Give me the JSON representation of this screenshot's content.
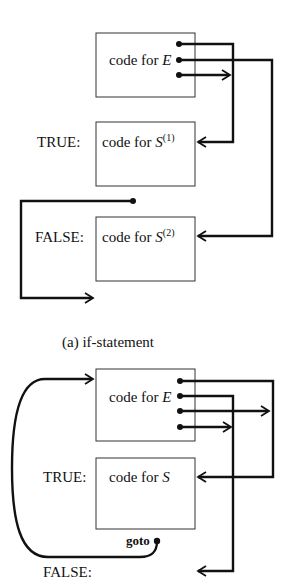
{
  "diagram_a": {
    "caption": "(a) if-statement",
    "blocks": [
      {
        "id": "E",
        "label_prefix": "code for ",
        "label_var": "E",
        "label_sup": ""
      },
      {
        "id": "S1",
        "label_prefix": "code for ",
        "label_var": "S",
        "label_sup": "(1)",
        "side_label": "TRUE:"
      },
      {
        "id": "S2",
        "label_prefix": "code for ",
        "label_var": "S",
        "label_sup": "(2)",
        "side_label": "FALSE:"
      }
    ]
  },
  "diagram_b": {
    "blocks": [
      {
        "id": "E",
        "label_prefix": "code for ",
        "label_var": "E",
        "label_sup": ""
      },
      {
        "id": "S",
        "label_prefix": "code for ",
        "label_var": "S",
        "label_sup": "",
        "side_label": "TRUE:"
      }
    ],
    "goto_label": "goto",
    "false_label": "FALSE:"
  },
  "colors": {
    "ink": "#111111",
    "background": "#ffffff"
  }
}
